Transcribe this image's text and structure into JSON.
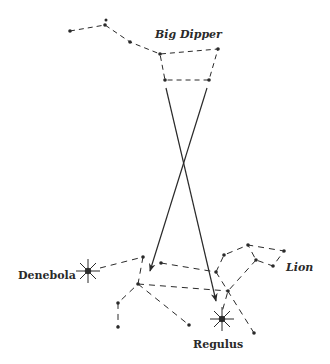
{
  "labels": {
    "big_dipper": "Big Dipper",
    "lion": "Lion",
    "denebola": "Denebola",
    "regulus": "Regulus"
  },
  "colors": {
    "ink": "#2a2a2a",
    "background": "#ffffff"
  }
}
